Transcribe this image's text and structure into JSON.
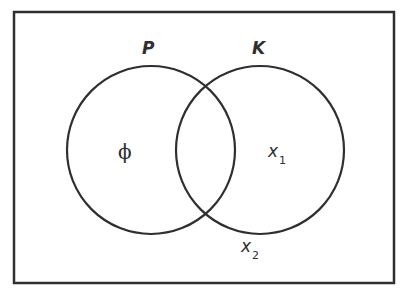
{
  "figure": {
    "type": "venn-diagram",
    "background_color": "#ffffff",
    "stroke_color": "#2f2f2f",
    "frame": {
      "x": 14,
      "y": 12,
      "width": 380,
      "height": 271,
      "stroke_width": 2.5
    },
    "circles": [
      {
        "id": "set-p",
        "label": "P",
        "cx": 151,
        "cy": 150,
        "r": 84,
        "stroke_width": 2.2
      },
      {
        "id": "set-k",
        "label": "K",
        "cx": 260,
        "cy": 150,
        "r": 84,
        "stroke_width": 2.2
      }
    ],
    "set_labels": {
      "left": "P",
      "right": "K"
    },
    "region_labels": {
      "left_only": "ϕ",
      "right_only_base": "x",
      "right_only_sub": "1",
      "outside_base": "x",
      "outside_sub": "2"
    }
  }
}
